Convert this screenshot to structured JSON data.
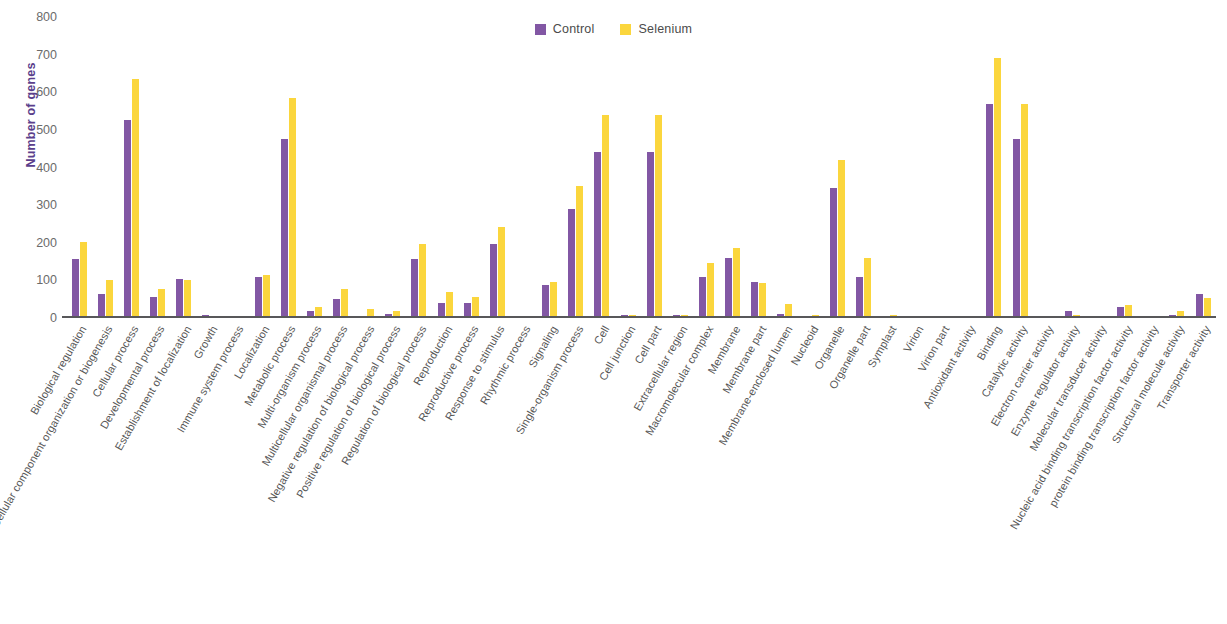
{
  "chart_data": {
    "type": "bar",
    "title": "",
    "xlabel": "",
    "ylabel": "Number of genes",
    "ylim": [
      0,
      800
    ],
    "yticks": [
      0,
      100,
      200,
      300,
      400,
      500,
      600,
      700,
      800
    ],
    "grid": false,
    "legend_position": "top-center",
    "colors": {
      "control": "#8257a4",
      "selenium": "#fbd63d",
      "axis": "#58585a",
      "ylabel": "#5b3f8c"
    },
    "categories": [
      "Biological regulation",
      "Cellular component organization or biogenesis",
      "Cellular process",
      "Developmental process",
      "Establishment of localization",
      "Growth",
      "Immune system process",
      "Localization",
      "Metabolic process",
      "Multi-organism process",
      "Multicellular organismal process",
      "Negative regulation of biological process",
      "Positive regulation of biological process",
      "Regulation of biological process",
      "Reproduction",
      "Reproductive process",
      "Response to stimulus",
      "Rhythmic process",
      "Signaling",
      "Single-organism process",
      "Cell",
      "Cell junction",
      "Cell part",
      "Extracellular region",
      "Macromolecular complex",
      "Membrane",
      "Membrane part",
      "Membrane-enclosed lumen",
      "Nucleoid",
      "Organelle",
      "Organelle part",
      "Symplast",
      "Virion",
      "Virion part",
      "Antioxidant activity",
      "Binding",
      "Catalytic activity",
      "Electron carrier activity",
      "Enzyme regulator activity",
      "Molecular transducer activity",
      "Nucleic acid binding transcription factor activity",
      "protein binding transcription factor activity",
      "Structural molecule activity",
      "Transporter activity"
    ],
    "series": [
      {
        "name": "Control",
        "color": "#8257a4",
        "values": [
          158,
          63,
          525,
          55,
          103,
          8,
          2,
          108,
          475,
          18,
          50,
          2,
          10,
          158,
          40,
          40,
          198,
          0,
          88,
          290,
          440,
          8,
          440,
          8,
          110,
          160,
          95,
          12,
          2,
          345,
          110,
          5,
          0,
          0,
          0,
          570,
          475,
          3,
          18,
          5,
          28,
          2,
          8,
          65
        ],
        "values_max": 570
      },
      {
        "name": "Selenium",
        "color": "#fbd63d",
        "values": [
          203,
          100,
          635,
          78,
          102,
          5,
          2,
          113,
          585,
          30,
          78,
          25,
          18,
          198,
          70,
          55,
          243,
          0,
          95,
          352,
          540,
          8,
          540,
          8,
          145,
          185,
          92,
          38,
          8,
          420,
          160,
          8,
          0,
          0,
          0,
          690,
          570,
          3,
          8,
          5,
          35,
          2,
          18,
          52
        ],
        "values_max": 690
      }
    ]
  },
  "legend": {
    "entries": [
      {
        "label": "Control",
        "color": "#8257a4"
      },
      {
        "label": "Selenium",
        "color": "#fbd63d"
      }
    ]
  },
  "axes": {
    "y_title": "Number of genes"
  }
}
